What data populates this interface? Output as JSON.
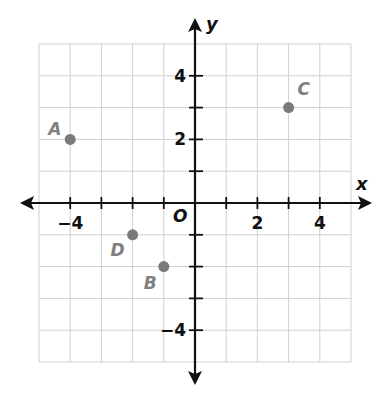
{
  "chart_data": {
    "type": "scatter",
    "title": "",
    "xlabel": "x",
    "ylabel": "y",
    "origin_label": "O",
    "xlim": [
      -5,
      5
    ],
    "ylim": [
      -5,
      5
    ],
    "grid": true,
    "x_ticks": [
      -4,
      -3,
      -2,
      -1,
      1,
      2,
      3,
      4
    ],
    "y_ticks": [
      -4,
      -3,
      -2,
      -1,
      1,
      2,
      3,
      4
    ],
    "x_tick_labels": [
      {
        "value": -4,
        "label": "−4"
      },
      {
        "value": 2,
        "label": "2"
      },
      {
        "value": 4,
        "label": "4"
      }
    ],
    "y_tick_labels": [
      {
        "value": 4,
        "label": "4"
      },
      {
        "value": 2,
        "label": "2"
      },
      {
        "value": -4,
        "label": "−4"
      }
    ],
    "points": [
      {
        "label": "A",
        "x": -4,
        "y": 2
      },
      {
        "label": "B",
        "x": -1,
        "y": -2
      },
      {
        "label": "C",
        "x": 3,
        "y": 3
      },
      {
        "label": "D",
        "x": -2,
        "y": -1
      }
    ],
    "colors": {
      "point": "#7a7a7a",
      "axis": "#111111",
      "grid": "#cfcfcf"
    }
  }
}
